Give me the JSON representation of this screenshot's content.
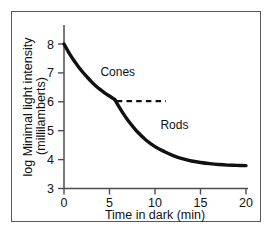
{
  "figure": {
    "background_color": "#ffffff",
    "frame_color": "#59595b",
    "curve_color": "#111111"
  },
  "chart_data": {
    "type": "line",
    "title": "",
    "subtitle": "",
    "xlabel": "Time in dark (min)",
    "ylabel": "log Minimal light intensity",
    "ylabel_line2": "(millilamberts)",
    "xlim": [
      0,
      20
    ],
    "ylim": [
      3,
      8
    ],
    "xticks": [
      0,
      5,
      10,
      15,
      20
    ],
    "xtick_labels": [
      "0",
      "5",
      "10",
      "15",
      "20"
    ],
    "yticks": [
      3,
      4,
      5,
      6,
      7,
      8
    ],
    "ytick_labels": [
      "3",
      "4",
      "5",
      "6",
      "7",
      "8"
    ],
    "grid": false,
    "legend": "inline-annotations",
    "series": [
      {
        "name": "Cones",
        "label_text": "Cones",
        "label_x": 4.0,
        "label_y": 6.9,
        "points": [
          {
            "x": 0.0,
            "y": 8.0
          },
          {
            "x": 0.5,
            "y": 7.72
          },
          {
            "x": 1.0,
            "y": 7.47
          },
          {
            "x": 1.5,
            "y": 7.25
          },
          {
            "x": 2.0,
            "y": 7.05
          },
          {
            "x": 2.5,
            "y": 6.87
          },
          {
            "x": 3.0,
            "y": 6.7
          },
          {
            "x": 3.5,
            "y": 6.55
          },
          {
            "x": 4.0,
            "y": 6.42
          },
          {
            "x": 4.5,
            "y": 6.3
          },
          {
            "x": 5.0,
            "y": 6.2
          },
          {
            "x": 5.6,
            "y": 6.07
          }
        ]
      },
      {
        "name": "Rods",
        "label_text": "Rods",
        "label_x": 10.6,
        "label_y": 5.05,
        "points": [
          {
            "x": 5.6,
            "y": 6.07
          },
          {
            "x": 6.0,
            "y": 5.85
          },
          {
            "x": 6.5,
            "y": 5.6
          },
          {
            "x": 7.0,
            "y": 5.37
          },
          {
            "x": 7.5,
            "y": 5.17
          },
          {
            "x": 8.0,
            "y": 4.98
          },
          {
            "x": 9.0,
            "y": 4.68
          },
          {
            "x": 10.0,
            "y": 4.45
          },
          {
            "x": 11.0,
            "y": 4.28
          },
          {
            "x": 12.0,
            "y": 4.14
          },
          {
            "x": 13.0,
            "y": 4.03
          },
          {
            "x": 14.0,
            "y": 3.95
          },
          {
            "x": 15.0,
            "y": 3.9
          },
          {
            "x": 16.0,
            "y": 3.86
          },
          {
            "x": 17.0,
            "y": 3.83
          },
          {
            "x": 18.0,
            "y": 3.81
          },
          {
            "x": 19.0,
            "y": 3.8
          },
          {
            "x": 20.0,
            "y": 3.79
          }
        ]
      }
    ],
    "annotations": [
      {
        "name": "rod-cone-break-reference-line",
        "type": "dashed-horizontal",
        "y": 6.02,
        "x_start": 5.8,
        "x_end": 11.2
      }
    ]
  }
}
